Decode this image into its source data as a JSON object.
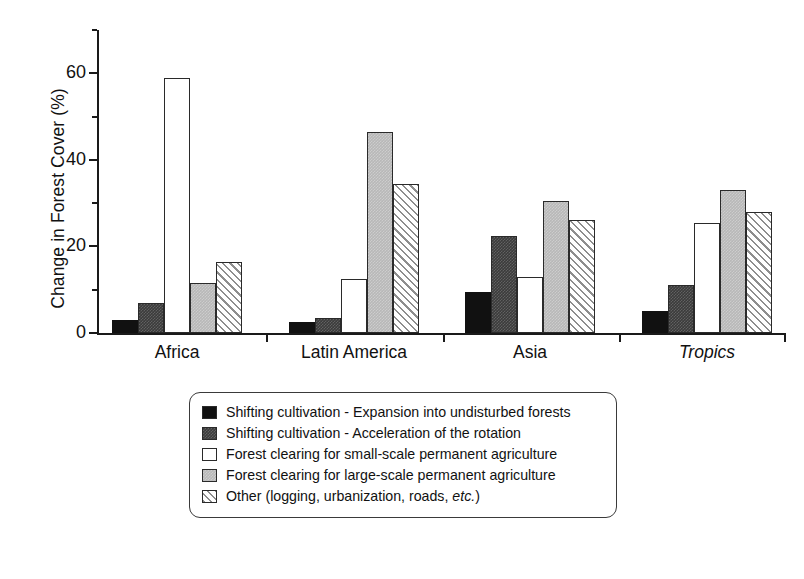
{
  "chart_data": {
    "type": "bar",
    "title": "",
    "xlabel": "",
    "ylabel": "Change in Forest Cover (%)",
    "categories": [
      "Africa",
      "Latin America",
      "Asia",
      "Tropics"
    ],
    "categories_italic": [
      false,
      false,
      false,
      true
    ],
    "ylim": [
      0,
      70
    ],
    "yticks": [
      0,
      20,
      40,
      60
    ],
    "yticklabels": [
      "0",
      "20",
      "40",
      "60"
    ],
    "yminorticks": [
      10,
      30,
      50,
      70
    ],
    "grid": false,
    "legend_position": "below-axes",
    "series": [
      {
        "name": "Shifting cultivation - Expansion into undisturbed forests",
        "style": "black",
        "values": [
          3.0,
          2.5,
          9.5,
          5.0
        ]
      },
      {
        "name": "Shifting cultivation - Acceleration of the rotation",
        "style": "darkgray",
        "values": [
          7.0,
          3.5,
          22.5,
          11.0
        ]
      },
      {
        "name": "Forest clearing for small-scale permanent agriculture",
        "style": "white",
        "values": [
          59.0,
          12.5,
          13.0,
          25.5
        ]
      },
      {
        "name": "Forest clearing for large-scale permanent agriculture",
        "style": "lightgray",
        "values": [
          11.5,
          46.5,
          30.5,
          33.0
        ]
      },
      {
        "name": "Other (logging, urbanization, roads, etc.)",
        "style": "hatch",
        "values": [
          16.5,
          34.5,
          26.0,
          28.0
        ]
      }
    ]
  },
  "legend": {
    "items": [
      {
        "label": "Shifting cultivation - Expansion into undisturbed forests",
        "style": "black"
      },
      {
        "label": "Shifting cultivation - Acceleration of the rotation",
        "style": "darkgray"
      },
      {
        "label": "Forest clearing for small-scale permanent agriculture",
        "style": "white"
      },
      {
        "label": "Forest clearing for large-scale permanent agriculture",
        "style": "lightgray"
      },
      {
        "label": "Other (logging, urbanization, roads, ",
        "label_italic": "etc.",
        "label_tail": ")",
        "style": "hatch"
      }
    ]
  },
  "colors": {
    "black": "#111111",
    "darkgray": "#3b3b3b",
    "white": "#ffffff",
    "lightgray": "#b8b8b8",
    "hatch_line": "#8e8e8e",
    "axis": "#1a1a1a"
  }
}
